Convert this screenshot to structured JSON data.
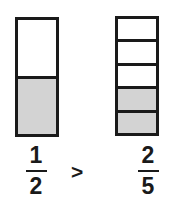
{
  "diagram": {
    "background_color": "#ffffff",
    "stroke_color": "#1a1a1a",
    "shaded_color": "#d3d3d3",
    "unshaded_color": "#ffffff"
  },
  "models": [
    {
      "name": "left-bar-model",
      "total_parts": 5,
      "parts": 2,
      "shaded_parts": 1,
      "fraction_text": "1/2",
      "cells": [
        {
          "shaded": false
        },
        {
          "shaded": true
        }
      ]
    },
    {
      "name": "right-bar-model",
      "parts": 5,
      "shaded_parts": 2,
      "fraction_text": "2/5",
      "cells": [
        {
          "shaded": false
        },
        {
          "shaded": false
        },
        {
          "shaded": false
        },
        {
          "shaded": true
        },
        {
          "shaded": true
        }
      ]
    }
  ],
  "labels": {
    "left_fraction": {
      "numerator": "1",
      "denominator": "2"
    },
    "operator": ">",
    "right_fraction": {
      "numerator": "2",
      "denominator": "5"
    }
  },
  "chart_data": {
    "type": "bar",
    "categories": [
      "1/2",
      "2/5"
    ],
    "values": [
      0.5,
      0.4
    ],
    "series": [
      {
        "name": "shaded fraction",
        "values": [
          0.5,
          0.4
        ]
      }
    ],
    "xlabel": "",
    "ylabel": "",
    "ylim": [
      0,
      1
    ],
    "grid": false,
    "legend": "none",
    "annotations": [
      ">"
    ]
  }
}
